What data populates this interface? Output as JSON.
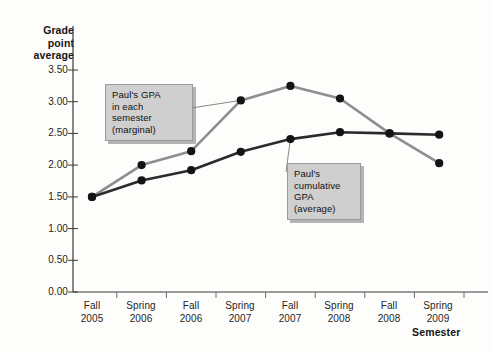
{
  "chart_data": {
    "type": "line",
    "title": "",
    "xlabel": "Semester",
    "ylabel": "Grade point average",
    "categories": [
      "Fall 2005",
      "Spring 2006",
      "Fall 2006",
      "Spring 2007",
      "Fall 2007",
      "Spring 2008",
      "Fall 2008",
      "Spring 2009"
    ],
    "category_lines": [
      {
        "term": "Fall",
        "year": "2005"
      },
      {
        "term": "Spring",
        "year": "2006"
      },
      {
        "term": "Fall",
        "year": "2006"
      },
      {
        "term": "Spring",
        "year": "2007"
      },
      {
        "term": "Fall",
        "year": "2007"
      },
      {
        "term": "Spring",
        "year": "2008"
      },
      {
        "term": "Fall",
        "year": "2008"
      },
      {
        "term": "Spring",
        "year": "2009"
      }
    ],
    "ylim": [
      0.0,
      3.5
    ],
    "ytick_labels": [
      "0.00",
      "0.50",
      "1.00",
      "1.50",
      "2.00",
      "2.50",
      "3.00",
      "3.50"
    ],
    "ytick_values": [
      0.0,
      0.5,
      1.0,
      1.5,
      2.0,
      2.5,
      3.0,
      3.5
    ],
    "grid": false,
    "legend_position": "annotations",
    "series": [
      {
        "name": "Paul's GPA in each semester (marginal)",
        "color": "#8e8e8e",
        "values": [
          1.5,
          2.0,
          2.22,
          3.02,
          3.25,
          3.05,
          2.5,
          2.03
        ]
      },
      {
        "name": "Paul's cumulative GPA (average)",
        "color": "#2b2b2b",
        "values": [
          1.5,
          1.76,
          1.92,
          2.21,
          2.41,
          2.52,
          2.5,
          2.48
        ]
      }
    ],
    "annotations": [
      {
        "id": "marginal",
        "lines": [
          "Paul's GPA",
          "in each",
          "semester",
          "(marginal)"
        ],
        "points_to_category": "Spring 2007"
      },
      {
        "id": "cumulative",
        "lines": [
          "Paul's",
          "cumulative",
          "GPA",
          "(average)"
        ],
        "points_to_category": "Fall 2007"
      }
    ]
  },
  "axes": {
    "y_title_lines": [
      "Grade",
      "point",
      "average"
    ],
    "x_title": "Semester"
  },
  "colors": {
    "marginal_line": "#8e8e8e",
    "cumulative_line": "#2b2b2b",
    "marker": "#141414",
    "axis": "#3a3a3a",
    "callout_bg": "#cfcfcf",
    "background": "#fdfdfb"
  }
}
